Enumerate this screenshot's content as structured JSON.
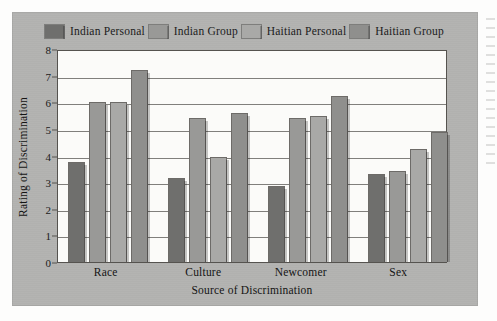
{
  "figure": {
    "background_color": "#b3b3b1",
    "plot_background_color": "#fbfbf9"
  },
  "legend": {
    "position": "top",
    "items": [
      {
        "label": "Indian Personal",
        "color": "#6f6f6d"
      },
      {
        "label": "Indian Group",
        "color": "#999997"
      },
      {
        "label": "Haitian Personal",
        "color": "#a9a9a7"
      },
      {
        "label": "Haitian Group",
        "color": "#8f8f8d"
      }
    ]
  },
  "axes": {
    "y_title": "Rating of Discrimination",
    "x_title": "Source of Discrimination",
    "y_ticks": [
      "0",
      "1",
      "2",
      "3",
      "4",
      "5",
      "6",
      "7",
      "8"
    ]
  },
  "chart_data": {
    "type": "bar",
    "title": "",
    "xlabel": "Source of Discrimination",
    "ylabel": "Rating of Discrimination",
    "ylim": [
      0,
      8
    ],
    "ytick_step": 1,
    "grid": true,
    "legend_position": "top",
    "categories": [
      "Race",
      "Culture",
      "Newcomer",
      "Sex"
    ],
    "series": [
      {
        "name": "Indian Personal",
        "color": "#6f6f6d",
        "values": [
          3.75,
          3.15,
          2.85,
          3.3
        ]
      },
      {
        "name": "Indian Group",
        "color": "#999997",
        "values": [
          6.0,
          5.4,
          5.4,
          3.4
        ]
      },
      {
        "name": "Haitian Personal",
        "color": "#a9a9a7",
        "values": [
          6.0,
          3.95,
          5.5,
          4.25
        ]
      },
      {
        "name": "Haitian Group",
        "color": "#8f8f8d",
        "values": [
          7.2,
          5.6,
          6.25,
          4.9
        ]
      }
    ]
  }
}
